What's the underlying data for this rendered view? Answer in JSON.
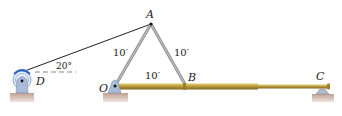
{
  "diagram": {
    "type": "statics-mechanism",
    "points": {
      "A": {
        "label": "A"
      },
      "B": {
        "label": "B"
      },
      "C": {
        "label": "C"
      },
      "D": {
        "label": "D"
      },
      "O": {
        "label": "O"
      }
    },
    "dimensions": {
      "OA": "10′",
      "AB": "10′",
      "OB": "10′"
    },
    "angle": {
      "label": "20°",
      "description": "cable DA angle above horizontal"
    },
    "colors": {
      "rod": "#b89a3a",
      "rod_highlight": "#e0c96a",
      "link": "#9a9a9a",
      "support": "#a9b8cc",
      "ground": "#c9aaa0",
      "pulley": "#4f7fc4"
    }
  }
}
